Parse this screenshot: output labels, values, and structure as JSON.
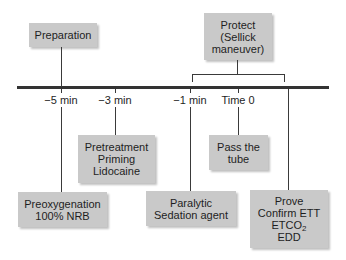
{
  "diagram": {
    "type": "timeline",
    "top_boxes": {
      "preparation": {
        "label": "Preparation"
      },
      "protect": {
        "lines": [
          "Protect",
          "(Sellick",
          "maneuver)"
        ]
      }
    },
    "timeline": {
      "ticks": [
        {
          "id": "t-5",
          "label": "−5 min"
        },
        {
          "id": "t-3",
          "label": "−3 min"
        },
        {
          "id": "t-1",
          "label": "−1 min"
        },
        {
          "id": "t0",
          "label": "Time 0"
        }
      ]
    },
    "bottom_boxes": {
      "preoxygenation": {
        "lines": [
          "Preoxygenation",
          "100% NRB"
        ]
      },
      "pretreatment": {
        "lines": [
          "Pretreatment",
          "Priming",
          "Lidocaine"
        ]
      },
      "paralytic": {
        "lines": [
          "Paralytic",
          "Sedation agent"
        ]
      },
      "pass_tube": {
        "lines": [
          "Pass the",
          "tube"
        ]
      },
      "prove": {
        "lines": [
          "Prove",
          "Confirm ETT",
          "ETCO",
          "EDD"
        ],
        "etco_subscript": "2"
      }
    },
    "colors": {
      "box_fill": "#c9c9c9",
      "line": "#333333",
      "text": "#1e1e1e"
    }
  }
}
